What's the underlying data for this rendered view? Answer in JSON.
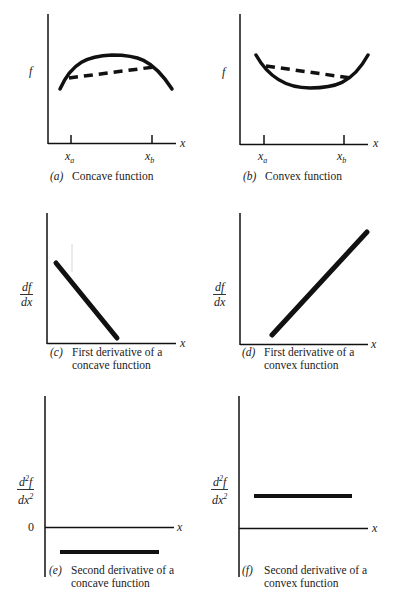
{
  "panels": {
    "a": {
      "tag": "(a)",
      "caption": "Concave function",
      "ylabel": "f",
      "xlabel": "x",
      "tick_labels": {
        "xa_base": "x",
        "xa_sub": "a",
        "xb_base": "x",
        "xb_sub": "b"
      }
    },
    "b": {
      "tag": "(b)",
      "caption": "Convex function",
      "ylabel": "f",
      "xlabel": "x",
      "tick_labels": {
        "xa_base": "x",
        "xa_sub": "a",
        "xb_base": "x",
        "xb_sub": "b"
      }
    },
    "c": {
      "tag": "(c)",
      "caption_line1": "First derivative of a",
      "caption_line2": "concave function",
      "ylabel_num": "df",
      "ylabel_den": "dx",
      "xlabel": "x"
    },
    "d": {
      "tag": "(d)",
      "caption_line1": "First derivative of a",
      "caption_line2": "convex function",
      "ylabel_num": "df",
      "ylabel_den": "dx",
      "xlabel": "x"
    },
    "e": {
      "tag": "(e)",
      "caption_line1": "Second derivative of a",
      "caption_line2": "concave function",
      "ylabel_num_base": "d",
      "ylabel_num_sup": "2",
      "ylabel_num_tail": "f",
      "ylabel_den_base": "dx",
      "ylabel_den_sup": "2",
      "zero_label": "0",
      "xlabel": "x"
    },
    "f": {
      "tag": "(f)",
      "caption_line1": "Second derivative of a",
      "caption_line2": "convex function",
      "ylabel_num_base": "d",
      "ylabel_num_sup": "2",
      "ylabel_num_tail": "f",
      "ylabel_den_base": "dx",
      "ylabel_den_sup": "2",
      "xlabel": "x"
    }
  },
  "colors": {
    "ink": "#111111",
    "background": "#ffffff"
  }
}
